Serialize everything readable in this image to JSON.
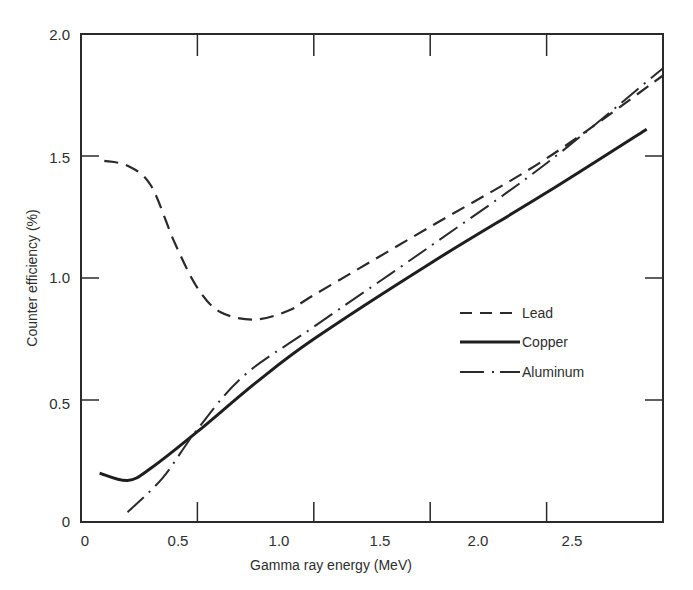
{
  "chart_data": {
    "type": "line",
    "title": "",
    "xlabel": "Gamma ray energy (MeV)",
    "ylabel": "Counter efficiency (%)",
    "xlim": [
      0,
      2.5
    ],
    "ylim": [
      0,
      2.0
    ],
    "xticks": [
      "0",
      "0.5",
      "1.0",
      "1.5",
      "2.0",
      "2.5"
    ],
    "yticks": [
      "0",
      "0.5",
      "1.0",
      "1.5",
      "2.0"
    ],
    "grid": false,
    "legend_position": "center-right",
    "series": [
      {
        "name": "Lead",
        "style": "dashed",
        "x": [
          0.1,
          0.2,
          0.3,
          0.4,
          0.5,
          0.6,
          0.75,
          0.9,
          1.0,
          1.5,
          2.0,
          2.5
        ],
        "values": [
          1.48,
          1.46,
          1.38,
          1.15,
          0.96,
          0.86,
          0.83,
          0.87,
          0.93,
          1.21,
          1.49,
          1.83
        ]
      },
      {
        "name": "Copper",
        "style": "solid",
        "x": [
          0.08,
          0.2,
          0.3,
          0.5,
          0.75,
          1.0,
          1.5,
          2.0,
          2.43
        ],
        "values": [
          0.2,
          0.17,
          0.22,
          0.37,
          0.57,
          0.75,
          1.06,
          1.35,
          1.61
        ]
      },
      {
        "name": "Aluminum",
        "style": "dash-dot",
        "x": [
          0.2,
          0.35,
          0.5,
          0.7,
          1.0,
          1.5,
          2.0,
          2.5
        ],
        "values": [
          0.04,
          0.18,
          0.38,
          0.6,
          0.8,
          1.13,
          1.47,
          1.86
        ]
      }
    ]
  },
  "legend": {
    "items": [
      {
        "label": "Lead"
      },
      {
        "label": "Copper"
      },
      {
        "label": "Aluminum"
      }
    ]
  },
  "colors": {
    "ink": "#2a2a2a",
    "background": "#ffffff"
  }
}
